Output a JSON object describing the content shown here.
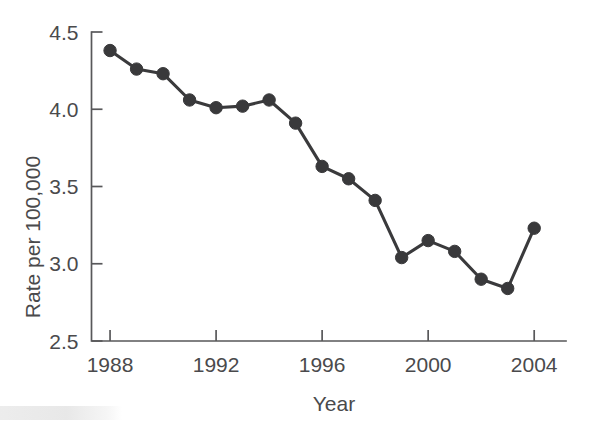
{
  "chart_data": {
    "type": "line",
    "title": "",
    "xlabel": "Year",
    "ylabel": "Rate per 100,000",
    "x": [
      1988,
      1989,
      1990,
      1991,
      1992,
      1993,
      1994,
      1995,
      1996,
      1997,
      1998,
      1999,
      2000,
      2001,
      2002,
      2003,
      2004
    ],
    "values": [
      4.38,
      4.26,
      4.23,
      4.06,
      4.01,
      4.02,
      4.06,
      3.91,
      3.63,
      3.55,
      3.41,
      3.04,
      3.15,
      3.08,
      2.9,
      2.84,
      3.23
    ],
    "series": [
      {
        "name": "Rate per 100,000",
        "values": [
          4.38,
          4.26,
          4.23,
          4.06,
          4.01,
          4.02,
          4.06,
          3.91,
          3.63,
          3.55,
          3.41,
          3.04,
          3.15,
          3.08,
          2.9,
          2.84,
          3.23
        ]
      }
    ],
    "xlim": [
      1987.3,
      2005.2
    ],
    "ylim": [
      2.5,
      4.5
    ],
    "x_tick_labels": [
      "1988",
      "1992",
      "1996",
      "2000",
      "2004"
    ],
    "x_tick_values": [
      1988,
      1992,
      1996,
      2000,
      2004
    ],
    "y_tick_labels": [
      "2.5",
      "3.0",
      "3.5",
      "4.0",
      "4.5"
    ],
    "y_tick_values": [
      2.5,
      3.0,
      3.5,
      4.0,
      4.5
    ],
    "grid": false,
    "legend": "none",
    "marker": "filled-circle",
    "line_color": "#39393b",
    "marker_color": "#39393b",
    "axis_color": "#58585a",
    "background_color": "#ffffff"
  },
  "artifacts": {
    "ghost_line_1": "",
    "ghost_line_2": ""
  }
}
